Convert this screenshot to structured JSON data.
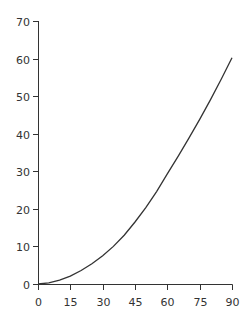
{
  "chart_data": {
    "type": "line",
    "title": "",
    "xlabel": "",
    "ylabel": "",
    "xlim": [
      0,
      90
    ],
    "ylim": [
      0,
      70
    ],
    "grid": false,
    "x_ticks": [
      0,
      15,
      30,
      45,
      60,
      75,
      90
    ],
    "y_ticks": [
      0,
      10,
      20,
      30,
      40,
      50,
      60,
      70
    ],
    "x": [
      0,
      5,
      10,
      15,
      20,
      25,
      30,
      35,
      40,
      45,
      50,
      55,
      60,
      65,
      70,
      75,
      80,
      85,
      90
    ],
    "series": [
      {
        "name": "curve",
        "color": "#333333",
        "values": [
          0,
          0.3,
          1.0,
          2.1,
          3.6,
          5.4,
          7.5,
          10.0,
          13.0,
          16.5,
          20.3,
          24.6,
          29.3,
          34.0,
          38.8,
          43.8,
          49.0,
          54.5,
          60.2
        ]
      }
    ]
  }
}
